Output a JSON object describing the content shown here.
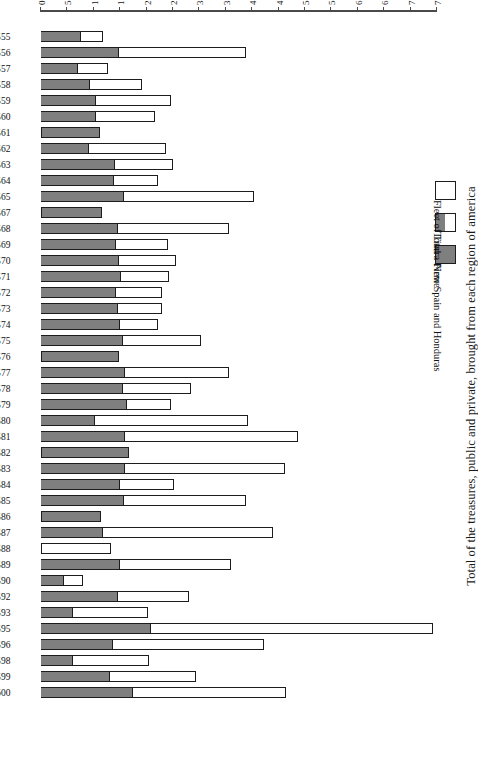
{
  "chart": {
    "title": "Total of the treasures, public and private, brought from each region of america",
    "axis_title": "million maravedis",
    "tick_labels": [
      "0",
      "500",
      "1000",
      "1 500",
      "2000",
      "2 500",
      "3000",
      "3 500",
      "4000",
      "4 500",
      "5000",
      "5 500",
      "6000",
      "6 500",
      "7000",
      "7 500"
    ],
    "legend": [
      {
        "label": "New Spain and Honduras",
        "swatch": "gray",
        "color": "#7f7f7f"
      },
      {
        "label": "Total",
        "swatch": "split",
        "color": "#7f7f7f"
      },
      {
        "label": "Fleet of Tierra Firme",
        "swatch": "white",
        "color": "#ffffff"
      }
    ]
  },
  "chart_data": {
    "type": "bar",
    "orientation": "horizontal-stacked",
    "title": "Total of the treasures, public and private, brought from each region of america",
    "xlabel": "million maravedis",
    "ylabel": "",
    "xlim": [
      0,
      7500
    ],
    "grid": false,
    "legend_position": "left",
    "categories": [
      "1600",
      "1599",
      "1598",
      "1596",
      "1595",
      "1593",
      "1592",
      "1590",
      "1589",
      "1588",
      "1587",
      "1586",
      "1585",
      "1584",
      "1583",
      "1582",
      "1581",
      "1580",
      "1579",
      "1578",
      "1577",
      "1576",
      "1575",
      "1574",
      "1573",
      "1572",
      "1571",
      "1570",
      "1569",
      "1568",
      "1567",
      "1565",
      "1564",
      "1563",
      "1562",
      "1561",
      "1560",
      "1559",
      "1558",
      "1557",
      "1556",
      "1555"
    ],
    "series": [
      {
        "name": "New Spain and Honduras",
        "color": "#7f7f7f",
        "values": [
          1740,
          1310,
          610,
          1360,
          2080,
          610,
          1450,
          440,
          1500,
          0,
          1170,
          1130,
          1580,
          1490,
          1600,
          1670,
          1590,
          1020,
          1620,
          1560,
          1590,
          1480,
          1560,
          1500,
          1460,
          1420,
          1520,
          1480,
          1420,
          1450,
          1150,
          1570,
          1380,
          1400,
          910,
          1120,
          1040,
          1050,
          920,
          700,
          1480,
          750
        ]
      },
      {
        "name": "Fleet of Tierra Firme",
        "color": "#ffffff",
        "values": [
          2900,
          1620,
          1440,
          2870,
          5340,
          1420,
          1360,
          350,
          2100,
          1330,
          3220,
          0,
          2300,
          1030,
          3020,
          0,
          3280,
          2910,
          840,
          1290,
          1980,
          0,
          1480,
          720,
          830,
          880,
          910,
          1080,
          990,
          2110,
          0,
          2470,
          830,
          1100,
          1460,
          0,
          1120,
          1420,
          1000,
          560,
          2400,
          420
        ]
      }
    ],
    "totals": [
      4640,
      2930,
      2050,
      4230,
      7420,
      2030,
      2810,
      790,
      3600,
      1330,
      4390,
      1130,
      3880,
      2520,
      4620,
      1670,
      4870,
      3930,
      2460,
      2850,
      3570,
      1480,
      3040,
      2220,
      2290,
      2300,
      2430,
      2560,
      2410,
      3560,
      1150,
      4040,
      2210,
      2500,
      2370,
      1120,
      2160,
      2470,
      1920,
      1260,
      3880,
      1170
    ]
  }
}
